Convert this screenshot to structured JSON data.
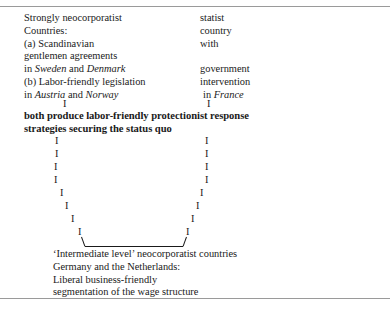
{
  "figure": {
    "rules": {
      "color": "#9a9a9a",
      "top_label": "top-rule",
      "bottom_label": "bottom-rule"
    },
    "left_branch": {
      "lines": [
        "Strongly neocorporatist",
        "Countries:",
        "(a) Scandinavian",
        "gentlemen agreements",
        "in Sweden and Denmark",
        "(b) Labor-friendly legislation",
        "in Austria and Norway"
      ],
      "line1": "Strongly neocorporatist",
      "line2": "Countries:",
      "line3": "(a) Scandinavian",
      "line4": "gentlemen agreements",
      "line5_pre": "in ",
      "line5_it1": "Sweden",
      "line5_mid": " and ",
      "line5_it2": "Denmark",
      "line6": "(b) Labor-friendly legislation",
      "line7_pre": "in ",
      "line7_it1": "Austria",
      "line7_mid": " and ",
      "line7_it2": "Norway"
    },
    "right_branch": {
      "lines": [
        "statist",
        "country",
        "with",
        "government",
        "intervention",
        "in France"
      ],
      "line1": "statist",
      "line2": "country",
      "line3": "with",
      "line4": "government",
      "line5": "intervention",
      "line6_pre": "in ",
      "line6_it": "France"
    },
    "statement": {
      "line1": "both produce labor-friendly protectionist response",
      "line2": "strategies securing the status quo"
    },
    "tick_glyph": "I",
    "outcome": {
      "line1": "‘Intermediate level’ neocorporatist countries",
      "line2": "Germany and the Netherlands:",
      "line3": "Liberal business-friendly",
      "line4": "segmentation of the wage structure"
    }
  }
}
